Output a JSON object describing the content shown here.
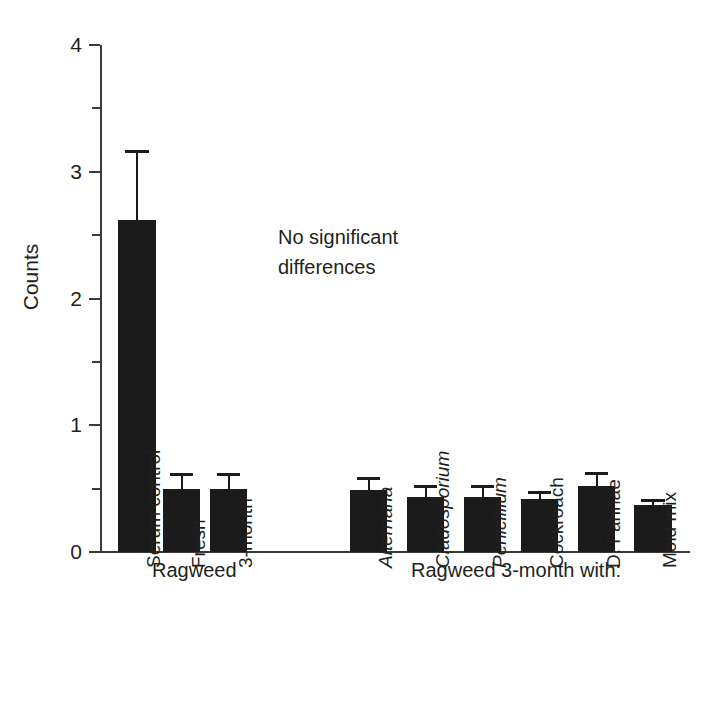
{
  "chart_data": {
    "type": "bar",
    "title": "",
    "xlabel": "",
    "ylabel": "Counts",
    "ylim": [
      0,
      4
    ],
    "ytick_labels": [
      "0",
      "1",
      "2",
      "3",
      "4"
    ],
    "ytick_values": [
      0,
      1,
      2,
      3,
      4
    ],
    "yminor_values": [
      0.5,
      1.5,
      2.5,
      3.5
    ],
    "grid": false,
    "legend": null,
    "categories": [
      "Serum control",
      "Fresh",
      "3-month",
      "Alternaria",
      "Cladosporium",
      "Penicillium",
      "Cockroach",
      "D. Farinae",
      "Mold mix"
    ],
    "values": [
      2.62,
      0.5,
      0.5,
      0.49,
      0.43,
      0.43,
      0.42,
      0.52,
      0.37
    ],
    "errors": [
      0.55,
      0.12,
      0.12,
      0.1,
      0.1,
      0.1,
      0.06,
      0.11,
      0.05
    ],
    "annotations": [
      "No significant\ndifferences"
    ],
    "group_labels": [
      "Ragweed",
      "Ragweed 3-month with:"
    ]
  },
  "axis": {
    "y_title": "Counts",
    "ticks": [
      {
        "label": "4",
        "value": 4
      },
      {
        "label": "3",
        "value": 3
      },
      {
        "label": "2",
        "value": 2
      },
      {
        "label": "1",
        "value": 1
      },
      {
        "label": "0",
        "value": 0
      }
    ]
  },
  "bars": [
    {
      "label": "Serum control",
      "value": 2.62,
      "error": 0.55,
      "italic": false,
      "x": 118,
      "width": 38
    },
    {
      "label": "Fresh",
      "value": 0.5,
      "error": 0.12,
      "italic": false,
      "x": 163,
      "width": 37
    },
    {
      "label": "3-month",
      "value": 0.5,
      "error": 0.12,
      "italic": false,
      "x": 210,
      "width": 37
    },
    {
      "label": "Alternaria",
      "value": 0.49,
      "error": 0.1,
      "italic": true,
      "x": 350,
      "width": 37
    },
    {
      "label": "Cladosporium",
      "value": 0.43,
      "error": 0.1,
      "italic": true,
      "x": 407,
      "width": 37
    },
    {
      "label": "Penicillium",
      "value": 0.43,
      "error": 0.1,
      "italic": true,
      "x": 464,
      "width": 37
    },
    {
      "label": "Cockroach",
      "value": 0.42,
      "error": 0.06,
      "italic": false,
      "x": 521,
      "width": 37
    },
    {
      "label": "D. Farinae",
      "value": 0.52,
      "error": 0.11,
      "italic": false,
      "x": 578,
      "width": 37
    },
    {
      "label": "Mold mix",
      "value": 0.37,
      "error": 0.05,
      "italic": false,
      "x": 634,
      "width": 38
    }
  ],
  "groups": [
    {
      "label": "Ragweed"
    },
    {
      "label": "Ragweed 3-month with:"
    }
  ],
  "annotation": {
    "text": "No significant\ndifferences"
  }
}
